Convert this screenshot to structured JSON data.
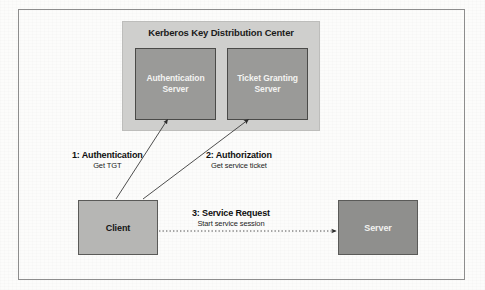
{
  "figure": {
    "background_color": "#fcfcfb",
    "frame_color": "#8d8d8d"
  },
  "kdc": {
    "title": "Kerberos Key Distribution Center",
    "fill_color": "#cfcfcd",
    "servers": [
      {
        "name": "authentication-server",
        "label": "Authentication\nServer",
        "fill_color": "#9a9a98",
        "text_color": "#f3f3f1"
      },
      {
        "name": "ticket-granting-server",
        "label": "Ticket Granting\nServer",
        "fill_color": "#9a9a98",
        "text_color": "#f3f3f1"
      }
    ]
  },
  "nodes": [
    {
      "name": "client",
      "label": "Client",
      "fill_color": "#b6b6b4",
      "text_color": "#141414"
    },
    {
      "name": "server",
      "label": "Server",
      "fill_color": "#8f8f8d",
      "text_color": "#f2f2f0"
    }
  ],
  "steps": [
    {
      "number": "1",
      "title": "1: Authentication",
      "subtitle": "Get TGT",
      "line_style": "solid",
      "from": "Client",
      "to": "Authentication Server"
    },
    {
      "number": "2",
      "title": "2: Authorization",
      "subtitle": "Get service ticket",
      "line_style": "solid",
      "from": "Client",
      "to": "Ticket Granting Server"
    },
    {
      "number": "3",
      "title": "3: Service Request",
      "subtitle": "Start service session",
      "line_style": "dotted",
      "from": "Client",
      "to": "Server"
    }
  ]
}
